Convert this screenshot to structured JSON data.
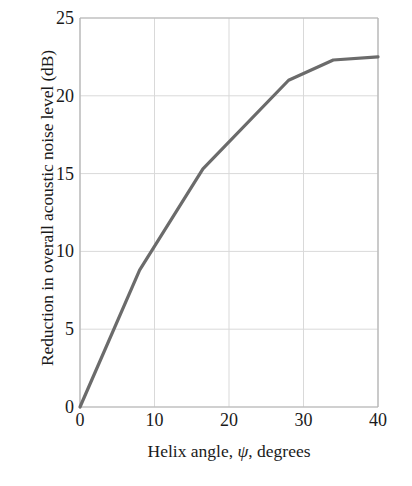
{
  "chart_data": {
    "type": "line",
    "title": "",
    "xlabel": "Helix angle, ψ, degrees",
    "ylabel": "Reduction in overall acoustic noise level (dB)",
    "xlabel_parts": {
      "prefix": "Helix angle, ",
      "symbol": "ψ",
      "suffix": ", degrees"
    },
    "xlim": [
      0,
      40
    ],
    "ylim": [
      0,
      25
    ],
    "xticks": [
      0,
      10,
      20,
      30,
      40
    ],
    "yticks": [
      0,
      5,
      10,
      15,
      20,
      25
    ],
    "xtick_labels": [
      "0",
      "10",
      "20",
      "30",
      "40"
    ],
    "ytick_labels": [
      "0",
      "5",
      "10",
      "15",
      "20",
      "25"
    ],
    "grid": true,
    "legend": null,
    "series": [
      {
        "name": "Noise reduction vs helix angle",
        "color": "#6b6b6b",
        "linewidth": 3.2,
        "x": [
          0,
          8,
          16.5,
          28,
          34,
          40
        ],
        "values": [
          0,
          8.8,
          15.3,
          21.0,
          22.3,
          22.5
        ],
        "points": [
          {
            "x": 0,
            "y": 0
          },
          {
            "x": 8,
            "y": 8.8
          },
          {
            "x": 16.5,
            "y": 15.3
          },
          {
            "x": 28,
            "y": 21.0
          },
          {
            "x": 34,
            "y": 22.3
          },
          {
            "x": 40,
            "y": 22.5
          }
        ]
      }
    ]
  },
  "style": {
    "line_color": "#6b6b6b",
    "grid_color": "#d9d9d9",
    "axis_color": "#b4b4b4",
    "text_color": "#1a1a1a",
    "background": "#ffffff"
  },
  "axis_names": {
    "x_axis": "helix-angle-degrees",
    "y_axis": "noise-reduction-db"
  }
}
